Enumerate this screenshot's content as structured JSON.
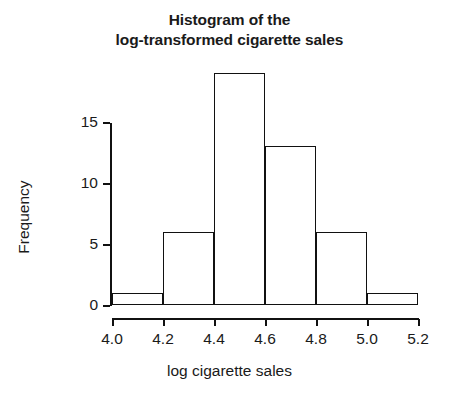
{
  "chart_data": {
    "type": "bar",
    "title": "Histogram of the log-transformed cigarette sales",
    "title_lines": [
      "Histogram of the",
      "log-transformed cigarette sales"
    ],
    "xlabel": "log cigarette sales",
    "ylabel": "Frequency",
    "xlim": [
      4.0,
      5.2
    ],
    "ylim": [
      0,
      19
    ],
    "grid": false,
    "legend": null,
    "bin_width": 0.2,
    "bin_edges": [
      4.0,
      4.2,
      4.4,
      4.6,
      4.8,
      5.0,
      5.2
    ],
    "categories": [
      "4.0-4.2",
      "4.2-4.4",
      "4.4-4.6",
      "4.6-4.8",
      "4.8-5.0",
      "5.0-5.2"
    ],
    "values": [
      1,
      6,
      19,
      13,
      6,
      1
    ],
    "bars": [
      {
        "label": "4.0-4.2",
        "x0": 4.0,
        "x1": 4.2,
        "frequency": 1
      },
      {
        "label": "4.2-4.4",
        "x0": 4.2,
        "x1": 4.4,
        "frequency": 6
      },
      {
        "label": "4.4-4.6",
        "x0": 4.4,
        "x1": 4.6,
        "frequency": 19
      },
      {
        "label": "4.6-4.8",
        "x0": 4.6,
        "x1": 4.8,
        "frequency": 13
      },
      {
        "label": "4.8-5.0",
        "x0": 4.8,
        "x1": 5.0,
        "frequency": 6
      },
      {
        "label": "5.0-5.2",
        "x0": 5.0,
        "x1": 5.2,
        "frequency": 1
      }
    ],
    "xticks": [
      {
        "value": 4.0,
        "label": "4.0"
      },
      {
        "value": 4.2,
        "label": "4.2"
      },
      {
        "value": 4.4,
        "label": "4.4"
      },
      {
        "value": 4.6,
        "label": "4.6"
      },
      {
        "value": 4.8,
        "label": "4.8"
      },
      {
        "value": 5.0,
        "label": "5.0"
      },
      {
        "value": 5.2,
        "label": "5.2"
      }
    ],
    "yticks": [
      {
        "value": 0,
        "label": "0"
      },
      {
        "value": 5,
        "label": "5"
      },
      {
        "value": 10,
        "label": "10"
      },
      {
        "value": 15,
        "label": "15"
      }
    ],
    "colors": {
      "bar_fill": "#ffffff",
      "bar_outline": "#111111",
      "axis": "#111111",
      "text": "#1a1a1a",
      "background": "#ffffff"
    }
  }
}
